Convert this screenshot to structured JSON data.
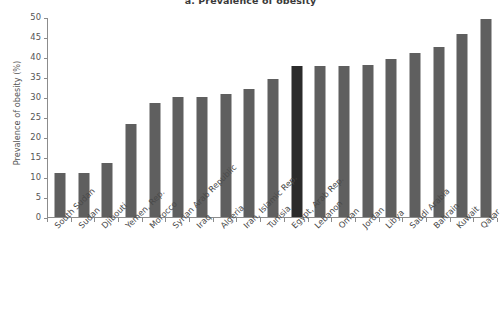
{
  "chart_data": {
    "type": "bar",
    "title": "a. Prevalence of obesity",
    "xlabel": "",
    "ylabel": "Prevalence of obesity (%)",
    "ylim": [
      0,
      50
    ],
    "yticks": [
      0,
      5,
      10,
      15,
      20,
      25,
      30,
      35,
      40,
      45,
      50
    ],
    "grid": false,
    "legend": null,
    "categories": [
      "South Sudan",
      "Sudan",
      "Djibouti",
      "Yemen, Rep.",
      "Morocco",
      "Syrian Arab Republic",
      "Iraq",
      "Algeria",
      "Iran, Islamic Rep.",
      "Tunisia",
      "Egypt, Arab Rep.",
      "Lebanon",
      "Oman",
      "Jordan",
      "Libya",
      "Saudi Arabia",
      "Bahrain",
      "Kuwait",
      "Qatar"
    ],
    "values": [
      11.0,
      11.0,
      13.5,
      23.3,
      28.5,
      30.0,
      30.0,
      30.7,
      32.0,
      34.5,
      37.7,
      37.8,
      37.8,
      38.0,
      39.5,
      41.0,
      42.5,
      45.8,
      49.5
    ],
    "highlight_index": 10,
    "colors": {
      "bar": "#5f5f5f",
      "bar_highlight": "#2b2b2b",
      "axis": "#8c8c8c",
      "text": "#4a4a4a",
      "background": "#ffffff"
    }
  }
}
